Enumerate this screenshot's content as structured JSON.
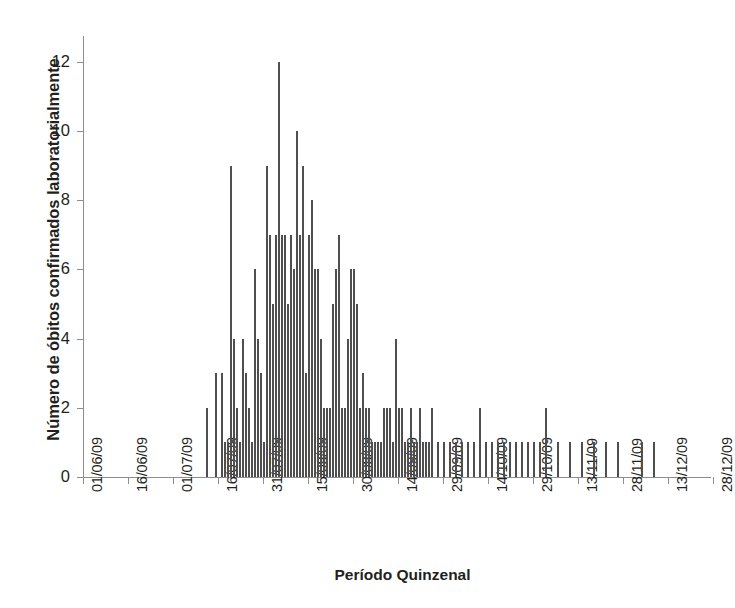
{
  "chart_data": {
    "type": "bar",
    "title": "",
    "xlabel": "Período Quinzenal",
    "ylabel": "Número de óbitos confirmados laboratorialmente",
    "ylim": [
      0,
      13
    ],
    "yticks": [
      0,
      2,
      4,
      6,
      8,
      10,
      12
    ],
    "ytick_labels": [
      "0",
      "2",
      "4",
      "6",
      "8",
      "10",
      "12"
    ],
    "grid": false,
    "legend": null,
    "xtick_labels": [
      "01/06/09",
      "16/06/09",
      "01/07/09",
      "16/07/09",
      "31/07/09",
      "15/08/09",
      "30/08/09",
      "14/09/09",
      "29/09/09",
      "14/10/09",
      "29/10/09",
      "13/11/09",
      "28/11/09",
      "13/12/09",
      "28/12/09"
    ],
    "xtick_days": [
      0,
      15,
      30,
      45,
      60,
      75,
      90,
      105,
      120,
      135,
      150,
      165,
      180,
      195,
      210
    ],
    "x_start_label": "01/06/09",
    "x_unit": "day index from 01/06/09",
    "bar_color": "#4f4f4f",
    "axis_color": "#8d8d8d",
    "series_name": "Óbitos confirmados laboratorialmente por dia",
    "x": [
      41,
      44,
      46,
      47,
      48,
      49,
      50,
      51,
      52,
      53,
      54,
      55,
      56,
      57,
      58,
      59,
      60,
      61,
      62,
      63,
      64,
      65,
      66,
      67,
      68,
      69,
      70,
      71,
      72,
      73,
      74,
      75,
      76,
      77,
      78,
      79,
      80,
      81,
      82,
      83,
      84,
      85,
      86,
      87,
      88,
      89,
      90,
      91,
      92,
      93,
      94,
      95,
      96,
      97,
      98,
      99,
      100,
      101,
      102,
      103,
      104,
      105,
      106,
      107,
      108,
      109,
      110,
      111,
      112,
      113,
      114,
      115,
      116,
      118,
      120,
      122,
      124,
      126,
      128,
      130,
      132,
      134,
      136,
      138,
      140,
      142,
      144,
      146,
      148,
      150,
      152,
      154,
      158,
      162,
      166,
      170,
      174,
      178,
      186,
      190
    ],
    "values": [
      2,
      3,
      3,
      1,
      1,
      9,
      4,
      2,
      1,
      4,
      3,
      2,
      1,
      6,
      4,
      3,
      1,
      9,
      7,
      5,
      7,
      12,
      7,
      7,
      5,
      7,
      6,
      10,
      7,
      9,
      3,
      7,
      8,
      6,
      6,
      4,
      2,
      2,
      2,
      5,
      6,
      7,
      2,
      2,
      4,
      6,
      6,
      5,
      2,
      3,
      2,
      2,
      1,
      1,
      1,
      1,
      2,
      2,
      2,
      1,
      4,
      2,
      2,
      1,
      1,
      2,
      1,
      1,
      2,
      1,
      1,
      1,
      2,
      1,
      1,
      1,
      1,
      1,
      1,
      1,
      2,
      1,
      1,
      1,
      1,
      1,
      1,
      1,
      1,
      1,
      1,
      2,
      1,
      1,
      1,
      1,
      1,
      1,
      1,
      1
    ],
    "peak": {
      "value": 12,
      "label": "12"
    }
  }
}
